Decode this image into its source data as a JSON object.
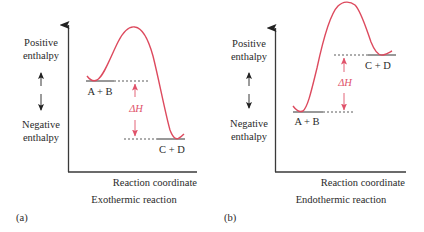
{
  "colors": {
    "curve": "#dd4a5e",
    "delta_h": "#e0526a",
    "axis": "#3a3a3a",
    "level": "#333333",
    "text": "#2a2a2a"
  },
  "panels": [
    {
      "id": "a",
      "panel_label": "(a)",
      "title": "Exothermic reaction",
      "xlabel": "Reaction coordinate",
      "y_top_label_1": "Positive",
      "y_top_label_2": "enthalpy",
      "y_bottom_label_1": "Negative",
      "y_bottom_label_2": "enthalpy",
      "reactants_label": "A + B",
      "products_label": "C + D",
      "delta_label": "ΔH"
    },
    {
      "id": "b",
      "panel_label": "(b)",
      "title": "Endothermic reaction",
      "xlabel": "Reaction coordinate",
      "y_top_label_1": "Positive",
      "y_top_label_2": "enthalpy",
      "y_bottom_label_1": "Negative",
      "y_bottom_label_2": "enthalpy",
      "reactants_label": "A + B",
      "products_label": "C + D",
      "delta_label": "ΔH"
    }
  ]
}
